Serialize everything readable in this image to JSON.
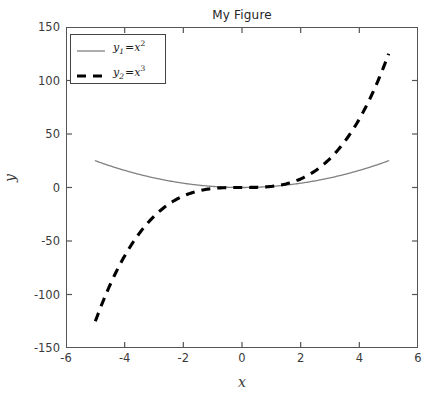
{
  "figure": {
    "title": "My Figure",
    "xlabel": "x",
    "ylabel": "y",
    "background": "#ffffff",
    "frame_color": "#555555"
  },
  "legend": {
    "border_color": "#444444",
    "entries": [
      {
        "label": "y1 =x²",
        "var": "y",
        "sub": "1",
        "eq": " =x",
        "sup": "2",
        "style": "solid",
        "color": "#808080",
        "width": 1.2
      },
      {
        "label": "y2 =x³",
        "var": "y",
        "sub": "2",
        "eq": " =x",
        "sup": "3",
        "style": "dashed",
        "color": "#000000",
        "width": 3.0
      }
    ]
  },
  "axes": {
    "xticks": [
      "-6",
      "-4",
      "-2",
      "0",
      "2",
      "4",
      "6"
    ],
    "yticks": [
      "150",
      "100",
      "50",
      "0",
      "-50",
      "-100",
      "-150"
    ]
  },
  "chart_data": {
    "type": "line",
    "title": "My Figure",
    "xlabel": "x",
    "ylabel": "y",
    "xlim": [
      -6,
      6
    ],
    "ylim": [
      -150,
      150
    ],
    "xticks": [
      -6,
      -4,
      -2,
      0,
      2,
      4,
      6
    ],
    "yticks": [
      -150,
      -100,
      -50,
      0,
      50,
      100,
      150
    ],
    "grid": false,
    "legend_position": "upper left",
    "x": [
      -5,
      -4.5,
      -4,
      -3.5,
      -3,
      -2.5,
      -2,
      -1.5,
      -1,
      -0.5,
      0,
      0.5,
      1,
      1.5,
      2,
      2.5,
      3,
      3.5,
      4,
      4.5,
      5
    ],
    "series": [
      {
        "name": "y1 = x^2",
        "style": "solid",
        "color": "#808080",
        "linewidth": 1.2,
        "values": [
          25,
          20.25,
          16,
          12.25,
          9,
          6.25,
          4,
          2.25,
          1,
          0.25,
          0,
          0.25,
          1,
          2.25,
          4,
          6.25,
          9,
          12.25,
          16,
          20.25,
          25
        ]
      },
      {
        "name": "y2 = x^3",
        "style": "dashed",
        "color": "#000000",
        "linewidth": 3.0,
        "values": [
          -125,
          -91.125,
          -64,
          -42.875,
          -27,
          -15.625,
          -8,
          -3.375,
          -1,
          -0.125,
          0,
          0.125,
          1,
          3.375,
          8,
          15.625,
          27,
          42.875,
          64,
          91.125,
          125
        ]
      }
    ]
  }
}
